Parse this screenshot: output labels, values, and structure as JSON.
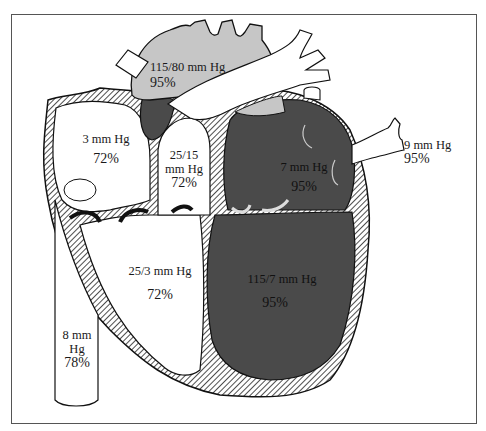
{
  "diagram": {
    "colors": {
      "oxygenated": "#4a4a4a",
      "aorta": "#c6c6c6",
      "deoxygenated": "#ffffff",
      "wall_hatch": "#222222",
      "frame": "#555555"
    },
    "labels": {
      "aorta": {
        "pressure": "115/80 mm Hg",
        "saturation": "95%"
      },
      "right_atrium": {
        "pressure": "3 mm Hg",
        "saturation": "72%"
      },
      "pulmonary_artery": {
        "pressure_line1": "25/15",
        "pressure_line2": "mm Hg",
        "saturation": "72%"
      },
      "left_atrium": {
        "pressure": "7 mm Hg",
        "saturation": "95%"
      },
      "pulmonary_veins": {
        "pressure": "9 mm Hg",
        "saturation": "95%"
      },
      "right_ventricle": {
        "pressure": "25/3 mm Hg",
        "saturation": "72%"
      },
      "left_ventricle": {
        "pressure": "115/7 mm Hg",
        "saturation": "95%"
      },
      "inferior_vena_cava": {
        "pressure_line1": "8 mm",
        "pressure_line2": "Hg",
        "saturation": "78%"
      }
    }
  }
}
